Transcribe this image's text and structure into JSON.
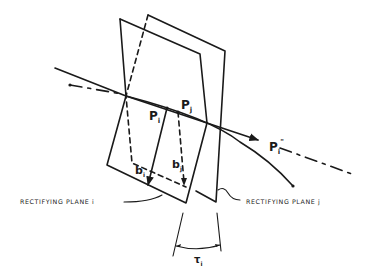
{
  "diagram": {
    "labels": {
      "p_i": "P",
      "p_i_sub": "i",
      "p_j": "P",
      "p_j_sub": "j",
      "p_i_dd": "P",
      "p_i_dd_sub": "i",
      "p_i_dd_sup": "\"",
      "b_i": "b",
      "b_i_sub": "i",
      "b_j": "b",
      "b_j_sub": "j",
      "tau": "τ",
      "tau_sub": "i"
    },
    "captions": {
      "plane_i": "RECTIFYING PLANE i",
      "plane_j": "RECTIFYING PLANE j"
    },
    "colors": {
      "ink": "#1a1a1a",
      "background": "#ffffff"
    }
  }
}
